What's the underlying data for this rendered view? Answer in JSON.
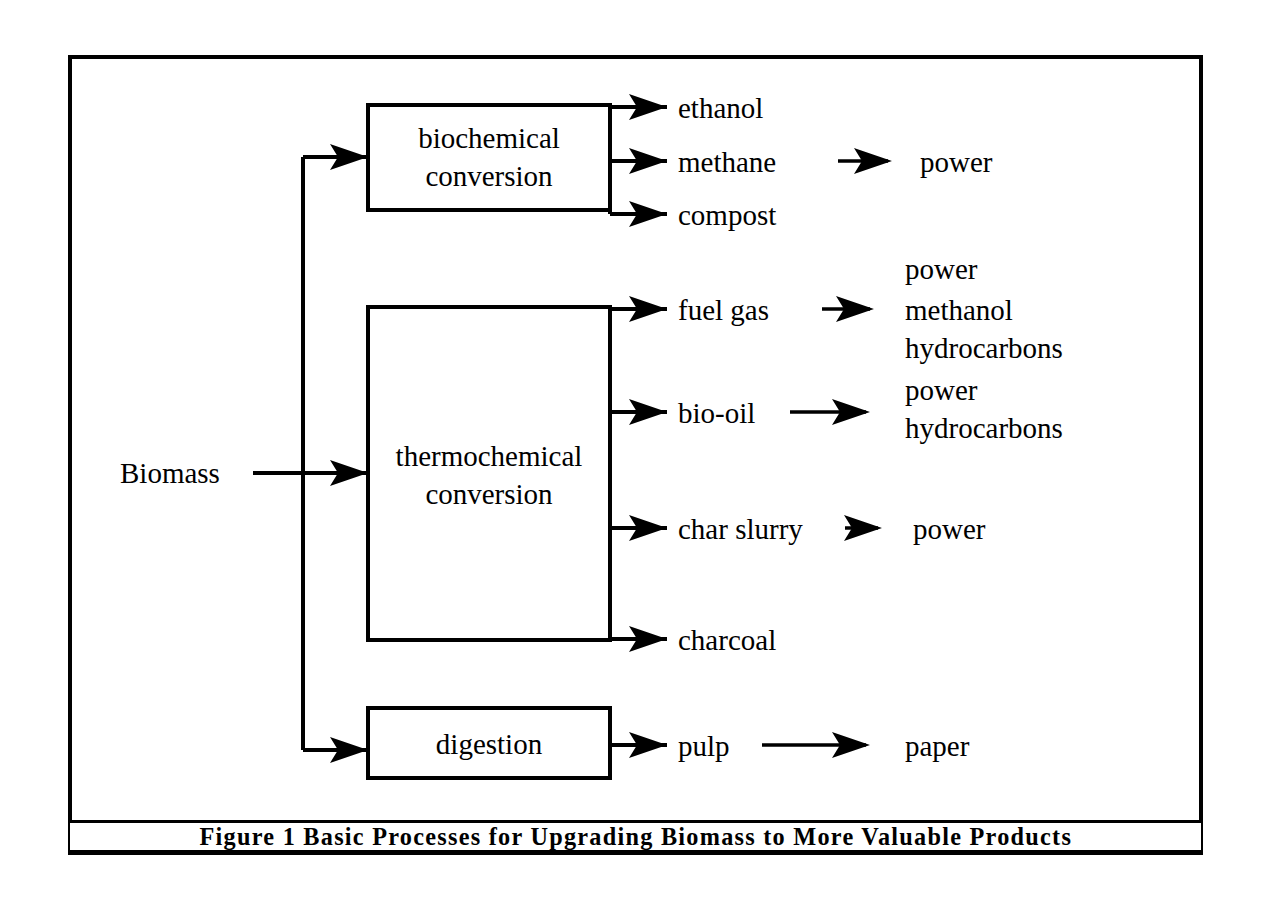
{
  "figure": {
    "caption_label": "Figure 1",
    "caption_title": "Basic Processes for Upgrading Biomass to More Valuable Products",
    "caption_full": "Figure 1    Basic Processes for Upgrading Biomass to More Valuable Products",
    "frame_color": "#000000",
    "background_color": "#ffffff"
  },
  "input": {
    "label": "Biomass"
  },
  "processes": [
    {
      "id": "biochemical",
      "line1": "biochemical",
      "line2": "conversion"
    },
    {
      "id": "thermochemical",
      "line1": "thermochemical",
      "line2": "conversion"
    },
    {
      "id": "digestion",
      "line1": "digestion",
      "line2": ""
    }
  ],
  "products": {
    "biochemical": [
      {
        "name": "ethanol",
        "downstream": []
      },
      {
        "name": "methane",
        "downstream": [
          "power"
        ]
      },
      {
        "name": "compost",
        "downstream": []
      }
    ],
    "thermochemical": [
      {
        "name": "fuel gas",
        "downstream": [
          "power",
          "methanol",
          "hydrocarbons"
        ]
      },
      {
        "name": "bio-oil",
        "downstream": [
          "power",
          "hydrocarbons"
        ]
      },
      {
        "name": "char slurry",
        "downstream": [
          "power"
        ]
      },
      {
        "name": "charcoal",
        "downstream": []
      }
    ],
    "digestion": [
      {
        "name": "pulp",
        "downstream": [
          "paper"
        ]
      }
    ]
  },
  "downstream_labels": {
    "methane_power": "power",
    "fuelgas_1": "power",
    "fuelgas_2": "methanol",
    "fuelgas_3": "hydrocarbons",
    "biooil_1": "power",
    "biooil_2": "hydrocarbons",
    "charslurry_power": "power",
    "pulp_paper": "paper"
  }
}
